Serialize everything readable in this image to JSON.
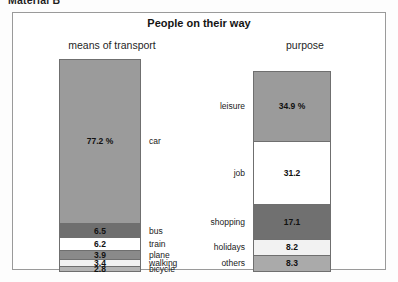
{
  "document": {
    "material_heading": "Material B"
  },
  "chart_frame": {
    "title": "People on their way",
    "panels": {
      "left_title": "means of transport",
      "right_title": "purpose"
    }
  },
  "chart_data": {
    "type": "bar",
    "title": "People on their way",
    "subtype": "stacked-100-percent",
    "grid": false,
    "legend": "none",
    "unit": "%",
    "series": [
      {
        "name": "means of transport",
        "categories": [
          "car",
          "bus",
          "train",
          "plane",
          "walking",
          "bicycle"
        ],
        "values": [
          77.2,
          6.5,
          6.2,
          3.9,
          3.4,
          2.8
        ],
        "labels": [
          "77.2 %",
          "6.5",
          "6.2",
          "3.9",
          "3.4",
          "2.8"
        ],
        "colors": [
          "#9b9b9b",
          "#6f6f6f",
          "#ffffff",
          "#8a8a8a",
          "#f2f2f2",
          "#b4b4b4"
        ]
      },
      {
        "name": "purpose",
        "categories": [
          "leisure",
          "job",
          "shopping",
          "holidays",
          "others"
        ],
        "values": [
          34.9,
          31.2,
          17.1,
          8.2,
          8.3
        ],
        "labels": [
          "34.9 %",
          "31.2",
          "17.1",
          "8.2",
          "8.3"
        ],
        "colors": [
          "#9b9b9b",
          "#ffffff",
          "#707070",
          "#f2f2f2",
          "#aaaaaa"
        ]
      }
    ]
  },
  "colors": {
    "frame_border": "#9a9a9a",
    "segment_border": "#6f6f6f",
    "page_background": "#fdfdfd",
    "text": "#1a1a1a"
  }
}
